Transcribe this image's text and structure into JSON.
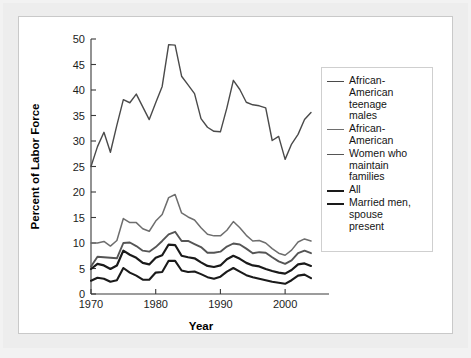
{
  "axes": {
    "ylabel": "Percent of Labor Force",
    "xlabel": "Year",
    "yticks": [
      "0",
      "5",
      "10",
      "15",
      "20",
      "25",
      "30",
      "35",
      "40",
      "45",
      "50"
    ],
    "xticks": [
      "1970",
      "1980",
      "1990",
      "2000"
    ]
  },
  "legend": {
    "entries": [
      {
        "label": "African-\nAmerican\nteenage\nmales",
        "color": "#4a4a4a",
        "width": 1.4
      },
      {
        "label": "African-\nAmerican",
        "color": "#6e6e6e",
        "width": 1.5
      },
      {
        "label": "Women who\nmaintain\nfamilies",
        "color": "#555555",
        "width": 1.9
      },
      {
        "label": "All",
        "color": "#1a1a1a",
        "width": 2.2
      },
      {
        "label": "Married men,\nspouse\npresent",
        "color": "#1a1a1a",
        "width": 2.1
      }
    ]
  },
  "chart_data": {
    "type": "line",
    "title": "",
    "xlabel": "Year",
    "ylabel": "Percent of Labor Force",
    "xlim": [
      1970,
      2004
    ],
    "ylim": [
      0,
      50
    ],
    "ytick_step": 5,
    "grid": false,
    "legend_position": "right",
    "x": [
      1970,
      1971,
      1972,
      1973,
      1974,
      1975,
      1976,
      1977,
      1978,
      1979,
      1980,
      1981,
      1982,
      1983,
      1984,
      1985,
      1986,
      1987,
      1988,
      1989,
      1990,
      1991,
      1992,
      1993,
      1994,
      1995,
      1996,
      1997,
      1998,
      1999,
      2000,
      2001,
      2002,
      2003,
      2004
    ],
    "series": [
      {
        "name": "African-American teenage males",
        "color": "#4a4a4a",
        "width": 1.4,
        "values": [
          25.0,
          28.9,
          31.7,
          27.8,
          33.1,
          38.1,
          37.5,
          39.2,
          36.7,
          34.2,
          37.5,
          40.7,
          48.9,
          48.8,
          42.7,
          41.0,
          39.3,
          34.4,
          32.7,
          31.9,
          31.8,
          36.5,
          41.9,
          40.1,
          37.6,
          37.1,
          36.9,
          36.5,
          30.1,
          30.9,
          26.4,
          29.4,
          31.3,
          34.2,
          35.6
        ]
      },
      {
        "name": "African-American",
        "color": "#6e6e6e",
        "width": 1.5,
        "values": [
          10.0,
          10.0,
          10.3,
          9.4,
          10.5,
          14.8,
          14.0,
          14.0,
          12.8,
          12.3,
          14.3,
          15.6,
          18.9,
          19.5,
          15.9,
          15.1,
          14.5,
          13.0,
          11.7,
          11.4,
          11.4,
          12.5,
          14.2,
          13.0,
          11.5,
          10.4,
          10.5,
          10.0,
          8.9,
          8.0,
          7.6,
          8.6,
          10.2,
          10.8,
          10.4
        ]
      },
      {
        "name": "Women who maintain families",
        "color": "#555555",
        "width": 1.9,
        "values": [
          5.4,
          7.3,
          7.2,
          7.1,
          7.0,
          10.0,
          10.1,
          9.4,
          8.5,
          8.3,
          9.2,
          10.4,
          11.7,
          12.2,
          10.4,
          10.4,
          9.8,
          9.2,
          8.1,
          8.1,
          8.3,
          9.3,
          9.9,
          9.7,
          8.9,
          8.0,
          8.2,
          8.1,
          7.2,
          6.4,
          5.9,
          6.6,
          8.0,
          8.5,
          8.0
        ]
      },
      {
        "name": "All",
        "color": "#1a1a1a",
        "width": 2.2,
        "values": [
          4.9,
          5.9,
          5.6,
          4.9,
          5.6,
          8.5,
          7.7,
          7.1,
          6.1,
          5.8,
          7.1,
          7.6,
          9.7,
          9.6,
          7.5,
          7.2,
          7.0,
          6.2,
          5.5,
          5.3,
          5.6,
          6.8,
          7.5,
          6.9,
          6.1,
          5.6,
          5.4,
          4.9,
          4.5,
          4.2,
          4.0,
          4.7,
          5.8,
          6.0,
          5.5
        ]
      },
      {
        "name": "Married men, spouse present",
        "color": "#1a1a1a",
        "width": 2.1,
        "values": [
          2.6,
          3.2,
          3.0,
          2.4,
          2.7,
          5.1,
          4.2,
          3.6,
          2.8,
          2.8,
          4.2,
          4.3,
          6.5,
          6.5,
          4.6,
          4.3,
          4.4,
          3.9,
          3.3,
          3.0,
          3.4,
          4.4,
          5.1,
          4.4,
          3.7,
          3.3,
          3.0,
          2.7,
          2.4,
          2.2,
          2.0,
          2.7,
          3.6,
          3.8,
          3.1
        ]
      }
    ]
  }
}
